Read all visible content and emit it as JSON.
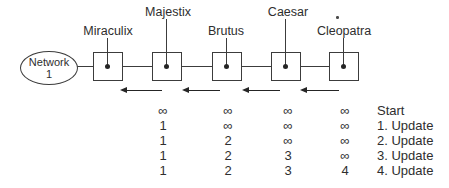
{
  "figure": {
    "network": {
      "line1": "Network",
      "line2": "1"
    },
    "routers": [
      "Miraculix",
      "Majestix",
      "Brutus",
      "Caesar",
      "Cleopatra"
    ],
    "arrow_direction": "left",
    "colors": {
      "ink": "#2e2e2e",
      "line": "#3c3c3c",
      "background": "#ffffff"
    }
  },
  "table": {
    "rows": [
      {
        "values": [
          "∞",
          "∞",
          "∞",
          "∞"
        ],
        "label": "Start"
      },
      {
        "values": [
          "1",
          "∞",
          "∞",
          "∞"
        ],
        "label": "1. Update"
      },
      {
        "values": [
          "1",
          "2",
          "∞",
          "∞"
        ],
        "label": "2. Update"
      },
      {
        "values": [
          "1",
          "2",
          "3",
          "∞"
        ],
        "label": "3. Update"
      },
      {
        "values": [
          "1",
          "2",
          "3",
          "4"
        ],
        "label": "4. Update"
      }
    ]
  }
}
